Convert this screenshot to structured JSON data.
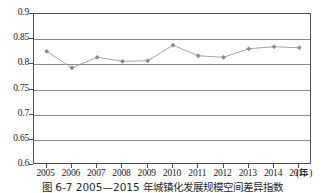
{
  "caption": "图 6-7  2005—2015 年城镇化发展规模空间差异指数",
  "chart_data": {
    "type": "line",
    "title": "",
    "subtitle": "",
    "xlabel": "(年)",
    "ylabel": "",
    "x": [
      2005,
      2006,
      2007,
      2008,
      2009,
      2010,
      2011,
      2012,
      2013,
      2014,
      2015
    ],
    "categories": [
      "2005",
      "2006",
      "2007",
      "2008",
      "2009",
      "2010",
      "2011",
      "2012",
      "2013",
      "2014",
      "2015"
    ],
    "values": [
      0.826,
      0.793,
      0.814,
      0.806,
      0.807,
      0.838,
      0.817,
      0.814,
      0.831,
      0.835,
      0.833
    ],
    "series": [
      {
        "name": "城镇化发展规模空间差异指数",
        "values": [
          0.826,
          0.793,
          0.814,
          0.806,
          0.807,
          0.838,
          0.817,
          0.814,
          0.831,
          0.835,
          0.833
        ]
      }
    ],
    "ylim": [
      0.6,
      0.9
    ],
    "yticks": [
      0.6,
      0.65,
      0.7,
      0.75,
      0.8,
      0.85,
      0.9
    ],
    "ytick_labels": [
      "0.6",
      "0.65",
      "0.7",
      "0.75",
      "0.8",
      "0.85",
      "0.9"
    ],
    "xtick_labels": [
      "2005",
      "2006",
      "2007",
      "2008",
      "2009",
      "2010",
      "2011",
      "2012",
      "2013",
      "2014",
      "2015"
    ],
    "grid": true,
    "grid_axis": "y",
    "legend": false,
    "legend_position": "none",
    "marker": "diamond",
    "line_color": "#9a9a9a",
    "marker_color": "#8c8c8c",
    "axis_color": "#4d4d4d",
    "grid_color": "#8a8a8a",
    "background_color": "#ffffff"
  }
}
